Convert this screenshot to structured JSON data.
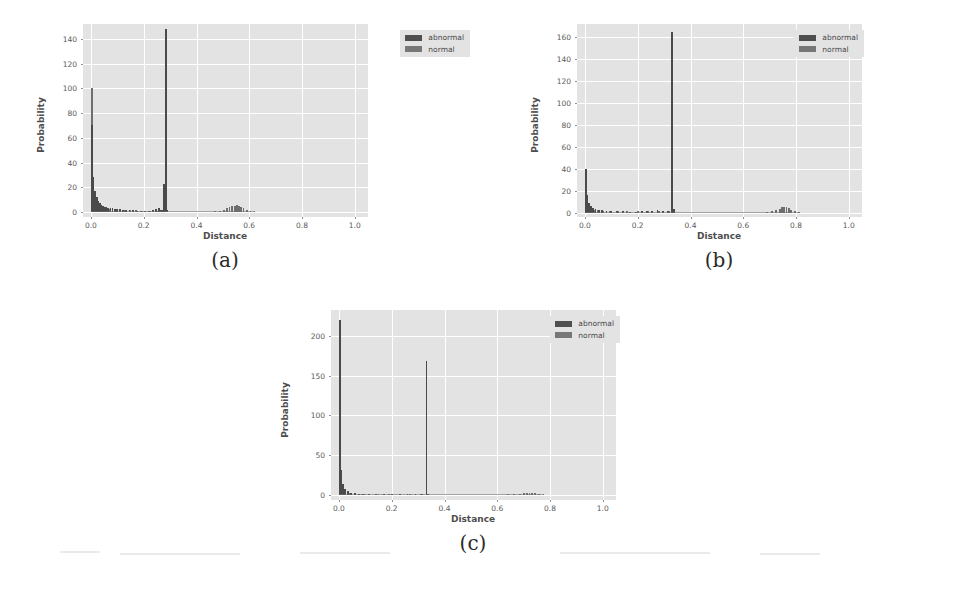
{
  "figure": {
    "panels": [
      {
        "id": "a",
        "caption": "(a)",
        "legend": [
          {
            "label": "abnormal",
            "color": "#4f4f4f"
          },
          {
            "label": "normal",
            "color": "#777777"
          }
        ],
        "chart_data": {
          "type": "bar",
          "title": "",
          "xlabel": "Distance",
          "ylabel": "Probability",
          "xlim": [
            -0.03,
            1.05
          ],
          "ylim": [
            -4,
            152
          ],
          "grid": true,
          "legend_position": "upper right",
          "xticks": [
            "0.0",
            "0.2",
            "0.4",
            "0.6",
            "0.8",
            "1.0"
          ],
          "xtick_values": [
            0.0,
            0.2,
            0.4,
            0.6,
            0.8,
            1.0
          ],
          "yticks": [
            "0",
            "20",
            "40",
            "60",
            "80",
            "100",
            "120",
            "140"
          ],
          "ytick_values": [
            0,
            20,
            40,
            60,
            80,
            100,
            120,
            140
          ],
          "series": [
            {
              "name": "abnormal",
              "x": [
                0.004,
                0.01,
                0.016,
                0.022,
                0.028,
                0.034,
                0.04,
                0.046,
                0.052,
                0.058,
                0.066,
                0.074,
                0.082,
                0.09,
                0.1,
                0.11,
                0.122,
                0.134,
                0.146,
                0.16,
                0.175,
                0.19,
                0.205,
                0.22,
                0.235,
                0.248,
                0.258,
                0.266,
                0.272,
                0.278,
                0.283,
                0.288
              ],
              "values": [
                70,
                28,
                17,
                12,
                9,
                7,
                6,
                5,
                4.5,
                4,
                3.5,
                3.2,
                3,
                2.8,
                2.5,
                2.2,
                2,
                1.8,
                1.5,
                1.4,
                1.2,
                1.1,
                1.0,
                1.0,
                1.5,
                2.4,
                3.0,
                2.0,
                1.4,
                23,
                148,
                2
              ]
            },
            {
              "name": "normal",
              "x": [
                0.004,
                0.012,
                0.02,
                0.03,
                0.042,
                0.056,
                0.072,
                0.09,
                0.11,
                0.13,
                0.15,
                0.17,
                0.195,
                0.225,
                0.25,
                0.278,
                0.47,
                0.49,
                0.505,
                0.515,
                0.525,
                0.535,
                0.545,
                0.552,
                0.56,
                0.568,
                0.578,
                0.59,
                0.605,
                0.62
              ],
              "values": [
                100,
                10,
                6,
                4,
                3,
                2.5,
                2.2,
                2.0,
                1.8,
                1.6,
                1.5,
                1.3,
                1.2,
                1.1,
                1.0,
                1.2,
                0.8,
                1.2,
                2.0,
                3.0,
                3.8,
                4.6,
                5.2,
                5.6,
                5.0,
                4.2,
                3.0,
                2.0,
                1.2,
                0.8
              ]
            }
          ]
        }
      },
      {
        "id": "b",
        "caption": "(b)",
        "legend": [
          {
            "label": "abnormal",
            "color": "#4f4f4f"
          },
          {
            "label": "normal",
            "color": "#777777"
          }
        ],
        "chart_data": {
          "type": "bar",
          "title": "",
          "xlabel": "Distance",
          "ylabel": "Probability",
          "xlim": [
            -0.03,
            1.05
          ],
          "ylim": [
            -4,
            172
          ],
          "grid": true,
          "legend_position": "upper right",
          "xticks": [
            "0.0",
            "0.2",
            "0.4",
            "0.6",
            "0.8",
            "1.0"
          ],
          "xtick_values": [
            0.0,
            0.2,
            0.4,
            0.6,
            0.8,
            1.0
          ],
          "yticks": [
            "0",
            "20",
            "40",
            "60",
            "80",
            "100",
            "120",
            "140",
            "160"
          ],
          "ytick_values": [
            0,
            20,
            40,
            60,
            80,
            100,
            120,
            140,
            160
          ],
          "series": [
            {
              "name": "abnormal",
              "x": [
                0.004,
                0.01,
                0.016,
                0.022,
                0.03,
                0.04,
                0.052,
                0.066,
                0.082,
                0.1,
                0.12,
                0.145,
                0.17,
                0.195,
                0.215,
                0.235,
                0.255,
                0.275,
                0.295,
                0.315,
                0.33,
                0.336
              ],
              "values": [
                40,
                16,
                9,
                6,
                4,
                3,
                2.4,
                2.0,
                1.6,
                1.4,
                1.2,
                1.1,
                1.0,
                1.0,
                1.2,
                1.5,
                1.8,
                2.0,
                1.8,
                1.5,
                165,
                3
              ]
            },
            {
              "name": "normal",
              "x": [
                0.004,
                0.012,
                0.022,
                0.034,
                0.05,
                0.07,
                0.095,
                0.125,
                0.16,
                0.2,
                0.24,
                0.28,
                0.32,
                0.69,
                0.71,
                0.725,
                0.738,
                0.748,
                0.756,
                0.764,
                0.772,
                0.782,
                0.795,
                0.81
              ],
              "values": [
                36,
                8,
                4,
                2.6,
                2.0,
                1.6,
                1.4,
                1.2,
                1.2,
                1.4,
                1.6,
                1.8,
                1.4,
                0.8,
                1.4,
                2.4,
                3.6,
                4.8,
                5.6,
                5.0,
                4.0,
                2.8,
                1.6,
                0.9
              ]
            }
          ]
        }
      },
      {
        "id": "c",
        "caption": "(c)",
        "legend": [
          {
            "label": "abnormal",
            "color": "#4f4f4f"
          },
          {
            "label": "normal",
            "color": "#777777"
          }
        ],
        "chart_data": {
          "type": "bar",
          "title": "",
          "xlabel": "Distance",
          "ylabel": "Probability",
          "xlim": [
            -0.03,
            1.05
          ],
          "ylim": [
            -6,
            232
          ],
          "grid": true,
          "legend_position": "upper right",
          "xticks": [
            "0.0",
            "0.2",
            "0.4",
            "0.6",
            "0.8",
            "1.0"
          ],
          "xtick_values": [
            0.0,
            0.2,
            0.4,
            0.6,
            0.8,
            1.0
          ],
          "yticks": [
            "0",
            "50",
            "100",
            "150",
            "200"
          ],
          "ytick_values": [
            0,
            50,
            100,
            150,
            200
          ],
          "series": [
            {
              "name": "abnormal",
              "x": [
                0.004,
                0.01,
                0.016,
                0.024,
                0.034,
                0.046,
                0.06,
                0.076,
                0.094,
                0.115,
                0.14,
                0.17,
                0.2,
                0.23,
                0.26,
                0.29,
                0.315,
                0.332,
                0.338
              ],
              "values": [
                220,
                32,
                14,
                8,
                5,
                3.4,
                2.6,
                2.0,
                1.6,
                1.3,
                1.1,
                1.0,
                1.2,
                1.4,
                1.5,
                1.4,
                1.2,
                168,
                2
              ]
            },
            {
              "name": "normal",
              "x": [
                0.004,
                0.012,
                0.024,
                0.04,
                0.06,
                0.086,
                0.115,
                0.15,
                0.19,
                0.23,
                0.27,
                0.31,
                0.64,
                0.665,
                0.685,
                0.7,
                0.712,
                0.722,
                0.732,
                0.744,
                0.758,
                0.775
              ],
              "values": [
                34,
                7,
                3.4,
                2.2,
                1.8,
                1.5,
                1.3,
                1.2,
                1.2,
                1.3,
                1.4,
                1.3,
                0.8,
                1.2,
                1.8,
                2.6,
                3.2,
                3.4,
                3.0,
                2.2,
                1.4,
                0.8
              ]
            }
          ]
        }
      }
    ]
  }
}
